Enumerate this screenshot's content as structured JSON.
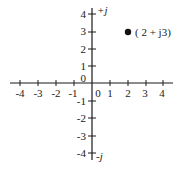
{
  "diagram": {
    "x_axis": {
      "ticks": [
        {
          "value": -4,
          "label": "-4"
        },
        {
          "value": -3,
          "label": "-3"
        },
        {
          "value": -2,
          "label": "-2"
        },
        {
          "value": -1,
          "label": "-1"
        },
        {
          "value": 0,
          "label": "0"
        },
        {
          "value": 1,
          "label": "1"
        },
        {
          "value": 2,
          "label": "2"
        },
        {
          "value": 3,
          "label": "3"
        },
        {
          "value": 4,
          "label": "4"
        }
      ]
    },
    "y_axis": {
      "positive_label": "+j",
      "negative_label": "-j",
      "ticks": [
        {
          "value": 4,
          "label": "4"
        },
        {
          "value": 3,
          "label": "3"
        },
        {
          "value": 2,
          "label": "2"
        },
        {
          "value": 1,
          "label": "1"
        },
        {
          "value": 0,
          "label": "0"
        },
        {
          "value": -1,
          "label": "-1"
        },
        {
          "value": -2,
          "label": "-2"
        },
        {
          "value": -3,
          "label": "-3"
        },
        {
          "value": -4,
          "label": "-4"
        }
      ]
    },
    "point": {
      "x": 2,
      "y": 3,
      "label": "( 2 + j3)"
    }
  }
}
